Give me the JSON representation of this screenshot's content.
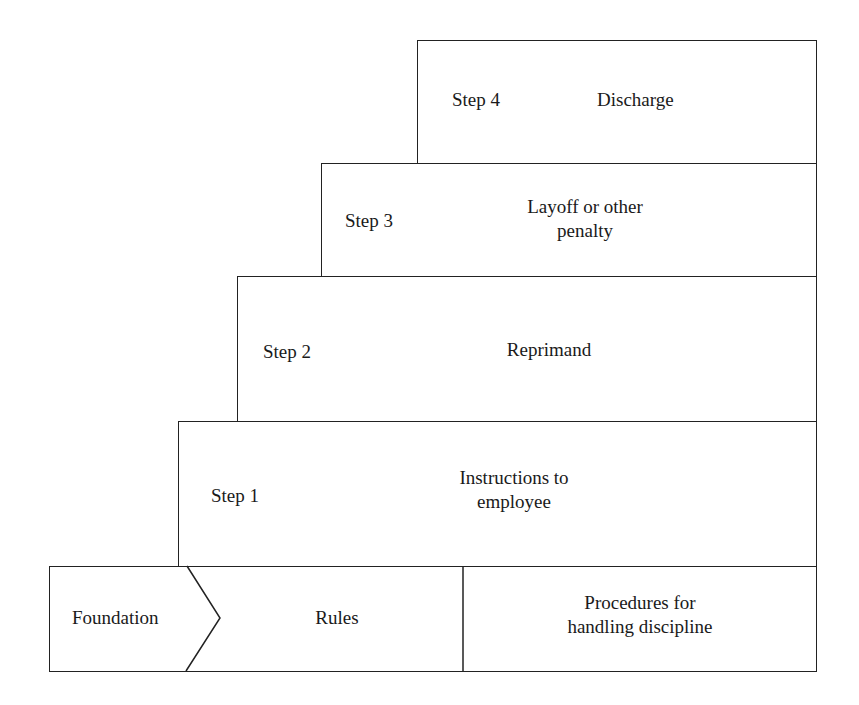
{
  "diagram": {
    "type": "staircase",
    "steps": [
      {
        "step": "Step 4",
        "action": "Discharge"
      },
      {
        "step": "Step 3",
        "action_line1": "Layoff or other",
        "action_line2": "penalty"
      },
      {
        "step": "Step 2",
        "action": "Reprimand"
      },
      {
        "step": "Step 1",
        "action_line1": "Instructions to",
        "action_line2": "employee"
      }
    ],
    "foundation": {
      "label": "Foundation",
      "rules": "Rules",
      "procedures_line1": "Procedures for",
      "procedures_line2": "handling discipline"
    }
  }
}
